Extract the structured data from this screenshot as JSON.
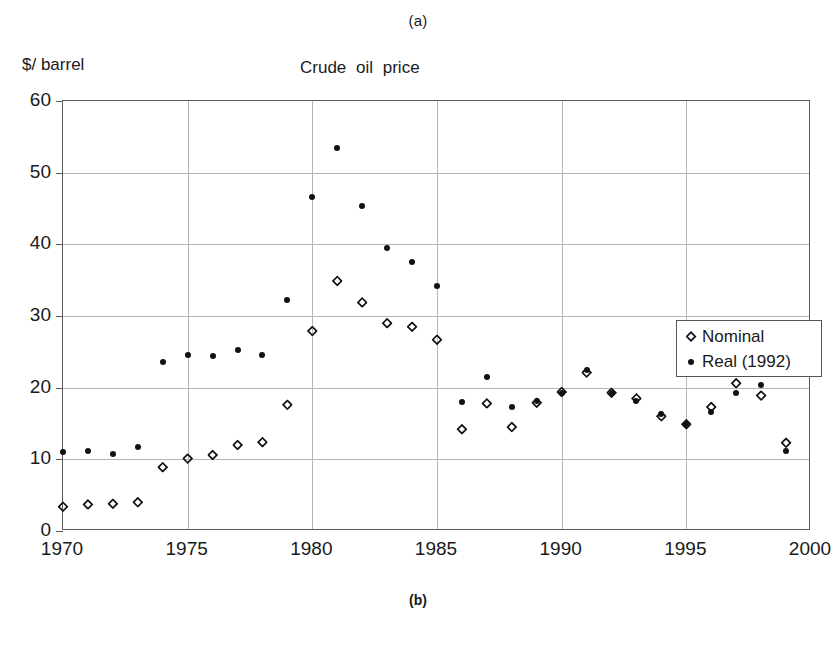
{
  "figure": {
    "panel_label_top": "(a)",
    "panel_label_bottom": "(b)"
  },
  "chart_data": {
    "type": "scatter",
    "title": "Crude  oil  price",
    "xlabel": "",
    "ylabel": "$/ barrel",
    "xlim": [
      1970,
      2000
    ],
    "ylim": [
      0,
      60
    ],
    "xticks": [
      1970,
      1975,
      1980,
      1985,
      1990,
      1995,
      2000
    ],
    "yticks": [
      0,
      10,
      20,
      30,
      40,
      50,
      60
    ],
    "xtick_labels": [
      "1970",
      "1975",
      "1980",
      "1985",
      "1990",
      "1995",
      "2000"
    ],
    "ytick_labels": [
      "0",
      "10",
      "20",
      "30",
      "40",
      "50",
      "60"
    ],
    "grid": true,
    "legend_position": "upper right inside",
    "legend": [
      "Nominal",
      "Real (1992)"
    ],
    "x": [
      1970,
      1971,
      1972,
      1973,
      1974,
      1975,
      1976,
      1977,
      1978,
      1979,
      1980,
      1981,
      1982,
      1983,
      1984,
      1985,
      1986,
      1987,
      1988,
      1989,
      1990,
      1991,
      1992,
      1993,
      1994,
      1995,
      1996,
      1997,
      1998,
      1999
    ],
    "series": [
      {
        "name": "Nominal",
        "marker": "open-diamond",
        "color": "#111111",
        "values": [
          3.4,
          3.7,
          3.8,
          4.0,
          8.9,
          10.1,
          10.6,
          12.0,
          12.4,
          17.6,
          27.9,
          34.9,
          31.9,
          29.0,
          28.5,
          26.7,
          14.2,
          17.8,
          14.5,
          17.9,
          19.4,
          22.1,
          19.3,
          18.5,
          16.0,
          14.9,
          17.3,
          20.6,
          18.9,
          12.3
        ]
      },
      {
        "name": "Real (1992)",
        "marker": "filled-dot",
        "color": "#111111",
        "values": [
          11.0,
          11.2,
          10.8,
          11.7,
          23.6,
          24.6,
          24.4,
          25.3,
          24.5,
          32.2,
          46.6,
          53.4,
          45.4,
          39.5,
          37.6,
          34.2,
          18.0,
          21.5,
          17.3,
          18.1,
          19.3,
          22.4,
          19.2,
          18.1,
          16.3,
          14.9,
          16.6,
          19.2,
          20.4,
          11.1
        ]
      }
    ]
  },
  "legend": {
    "items": [
      {
        "label": "Nominal",
        "marker": "open-diamond"
      },
      {
        "label": "Real (1992)",
        "marker": "filled-dot"
      }
    ]
  }
}
